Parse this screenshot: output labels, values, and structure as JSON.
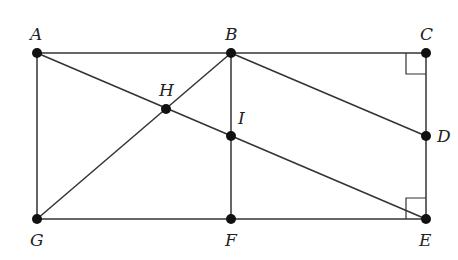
{
  "diagram": {
    "type": "geometry",
    "points": [
      {
        "name": "A",
        "x": 37,
        "y": 53,
        "lx": 30,
        "ly": 40
      },
      {
        "name": "B",
        "x": 231,
        "y": 53,
        "lx": 225,
        "ly": 40
      },
      {
        "name": "C",
        "x": 426,
        "y": 53,
        "lx": 420,
        "ly": 40
      },
      {
        "name": "D",
        "x": 426,
        "y": 136,
        "lx": 437,
        "ly": 142
      },
      {
        "name": "E",
        "x": 426,
        "y": 219,
        "lx": 419,
        "ly": 246
      },
      {
        "name": "F",
        "x": 231,
        "y": 219,
        "lx": 225,
        "ly": 246
      },
      {
        "name": "G",
        "x": 37,
        "y": 219,
        "lx": 30,
        "ly": 246
      },
      {
        "name": "H",
        "x": 166,
        "y": 109,
        "lx": 159,
        "ly": 96
      },
      {
        "name": "I",
        "x": 231,
        "y": 136,
        "lx": 238,
        "ly": 124
      }
    ],
    "segments": [
      [
        "A",
        "B"
      ],
      [
        "B",
        "C"
      ],
      [
        "A",
        "G"
      ],
      [
        "G",
        "F"
      ],
      [
        "F",
        "E"
      ],
      [
        "C",
        "D"
      ],
      [
        "D",
        "E"
      ],
      [
        "B",
        "F"
      ],
      [
        "A",
        "E"
      ],
      [
        "G",
        "B"
      ],
      [
        "B",
        "D"
      ]
    ],
    "right_angles": [
      "C",
      "E"
    ]
  }
}
